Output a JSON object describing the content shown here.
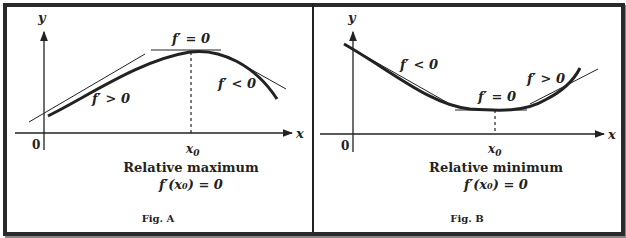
{
  "figures": [
    {
      "caption": "Fig. A",
      "axis_y": "y",
      "axis_x": "x",
      "origin": "0",
      "x_tick": "x",
      "x_tick_sub": "0",
      "slope_top": "f′ = 0",
      "slope_left": "f′ > 0",
      "slope_right": "f′ < 0",
      "title": "Relative maximum",
      "condition": "f′(x₀) = 0"
    },
    {
      "caption": "Fig. B",
      "axis_y": "y",
      "axis_x": "x",
      "origin": "0",
      "x_tick": "x",
      "x_tick_sub": "0",
      "slope_top": "f′ = 0",
      "slope_left": "f′ < 0",
      "slope_right": "f′ > 0",
      "title": "Relative minimum",
      "condition": "f′(x₀) = 0"
    }
  ],
  "colors": {
    "ink": "#222222",
    "border": "#2a2a2a",
    "background": "#ffffff"
  }
}
